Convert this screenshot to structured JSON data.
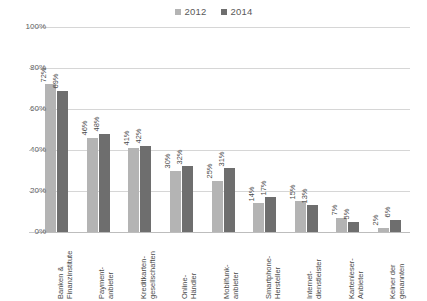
{
  "chart_data": {
    "type": "bar",
    "title": "",
    "subtitle": "",
    "xlabel": "",
    "ylabel": "",
    "ylim": [
      0,
      100
    ],
    "ytick_labels": [
      "0%",
      "20%",
      "40%",
      "60%",
      "80%",
      "100%"
    ],
    "ytick_values": [
      0,
      20,
      40,
      60,
      80,
      100
    ],
    "grid": "horizontal",
    "legend_position": "top-center",
    "value_suffix": "%",
    "categories": [
      "Banken &\nFinanzinstitute",
      "Payment-\nanbieter",
      "Kreditkarten-\ngesellschaften",
      "Online-\nHändler",
      "Mobilfunk-\nanbieter",
      "Smartphone-\nHersteller",
      "Internet-\ndienstleister",
      "Kartenleser-\nAnbieter",
      "Keiner der\ngenannten"
    ],
    "series": [
      {
        "name": "2012",
        "color": "#b4b4b4",
        "values": [
          72,
          46,
          41,
          30,
          25,
          14,
          15,
          7,
          2
        ],
        "labels": [
          "72%",
          "46%",
          "41%",
          "30%",
          "25%",
          "14%",
          "15%",
          "7%",
          "2%"
        ]
      },
      {
        "name": "2014",
        "color": "#6e6e6e",
        "values": [
          69,
          48,
          42,
          32,
          31,
          17,
          13,
          5,
          6
        ],
        "labels": [
          "69%",
          "48%",
          "42%",
          "32%",
          "31%",
          "17%",
          "13%",
          "5%",
          "6%"
        ]
      }
    ]
  }
}
